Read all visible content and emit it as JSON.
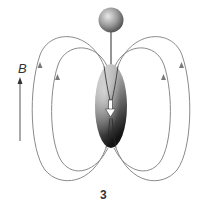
{
  "diagram": {
    "field_label": "B",
    "panel_number": "3",
    "elements": {
      "pivot_ball": "sphere",
      "rod": "vertical rod",
      "spheroid": "prolate spheroid magnet",
      "moment_arrow": "downward white arrow",
      "field_lines": "four closed dipole field loops with upward arrowheads",
      "field_arrow": "upward arrow indicating external field B"
    },
    "colors": {
      "field_line": "#8a8a8a",
      "spheroid_light": "#d9d9d9",
      "spheroid_dark": "#1e1e1e",
      "text": "#333333"
    }
  }
}
